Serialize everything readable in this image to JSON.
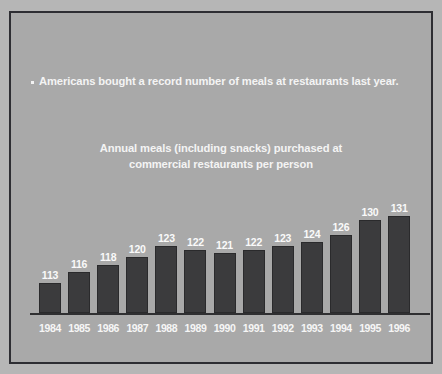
{
  "slide": {
    "bullet": {
      "marker": "square-bullet",
      "text": "Americans bought a record number of meals at restaurants last year."
    },
    "chart_title_line1": "Annual meals (including snacks) purchased at",
    "chart_title_line2": "commercial restaurants per person"
  },
  "colors": {
    "slide_background": "#b6b6b6",
    "panel_background": "#a9a9a9",
    "panel_border": "#2e2e33",
    "bar_fill": "#3b3b3d",
    "bar_outline": "#2a2a2c",
    "text": "#f4f4f4",
    "axis_line": "#2f2f31"
  },
  "chart_data": {
    "type": "bar",
    "title": "Annual meals (including snacks) purchased at commercial restaurants per person",
    "xlabel": "",
    "ylabel": "",
    "grid": false,
    "legend": "none",
    "baseline": 105,
    "ylim": [
      105,
      134
    ],
    "categories": [
      "1984",
      "1985",
      "1986",
      "1987",
      "1988",
      "1989",
      "1990",
      "1991",
      "1992",
      "1993",
      "1994",
      "1995",
      "1996"
    ],
    "values": [
      113,
      116,
      118,
      120,
      123,
      122,
      121,
      122,
      123,
      124,
      126,
      130,
      131
    ],
    "data_labels": [
      "113",
      "116",
      "118",
      "120",
      "123",
      "122",
      "121",
      "122",
      "123",
      "124",
      "126",
      "130",
      "131"
    ]
  }
}
